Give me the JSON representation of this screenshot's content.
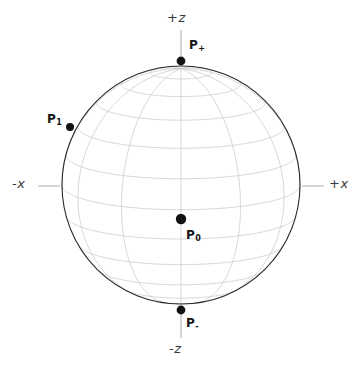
{
  "figure": {
    "background_color": "#ffffff",
    "width": 360,
    "height": 366
  },
  "axes": {
    "z_positive": {
      "label": "+z",
      "tick": true
    },
    "z_negative": {
      "label": "-z",
      "tick": true
    },
    "x_negative": {
      "label": "-x",
      "tick": true
    },
    "x_positive": {
      "label": "+x",
      "tick": true
    }
  },
  "points": {
    "p_plus": {
      "label_main": "P",
      "label_sub": "+"
    },
    "p_minus": {
      "label_main": "P",
      "label_sub": "-"
    },
    "p_one": {
      "label_main": "P",
      "label_sub": "1"
    },
    "p_zero": {
      "label_main": "P",
      "label_sub": "0"
    }
  },
  "chart_data": {
    "type": "scatter",
    "xlabel": "x",
    "ylabel": "z",
    "grid": true,
    "legend": null,
    "sphere": {
      "center_px": [
        181,
        185
      ],
      "radius_px": 119,
      "outline_color": "#2a2a2a",
      "grid_color": "#c9c9c9",
      "meridian_count": 12,
      "parallel_count": 11,
      "view_elevation_deg": 12
    },
    "axis_lines": [
      {
        "name": "+z",
        "label": "+z",
        "from_px": [
          181,
          30
        ],
        "to_px": [
          181,
          56
        ],
        "color": "#b5b5b5"
      },
      {
        "name": "-z",
        "label": "-z",
        "from_px": [
          181,
          314
        ],
        "to_px": [
          181,
          338
        ],
        "color": "#b5b5b5"
      },
      {
        "name": "-x",
        "label": "-x",
        "from_px": [
          38,
          186
        ],
        "to_px": [
          60,
          186
        ],
        "color": "#b5b5b5"
      },
      {
        "name": "+x",
        "label": "+x",
        "from_px": [
          302,
          186
        ],
        "to_px": [
          324,
          186
        ],
        "color": "#b5b5b5"
      }
    ],
    "points": [
      {
        "name": "P0",
        "label": "P0",
        "position_px": [
          181,
          219
        ],
        "radius_px": 5.2,
        "color": "#111111",
        "description": "sphere centre point"
      },
      {
        "name": "P+",
        "label": "P+",
        "position_px": [
          181,
          61
        ],
        "radius_px": 4.4,
        "color": "#111111",
        "description": "north pole on outline"
      },
      {
        "name": "P-",
        "label": "P-",
        "position_px": [
          181,
          310
        ],
        "radius_px": 4.4,
        "color": "#111111",
        "description": "south pole on outline"
      },
      {
        "name": "P1",
        "label": "P1",
        "position_px": [
          70,
          127
        ],
        "radius_px": 4.0,
        "color": "#111111",
        "description": "point on upper-left limb"
      }
    ]
  }
}
